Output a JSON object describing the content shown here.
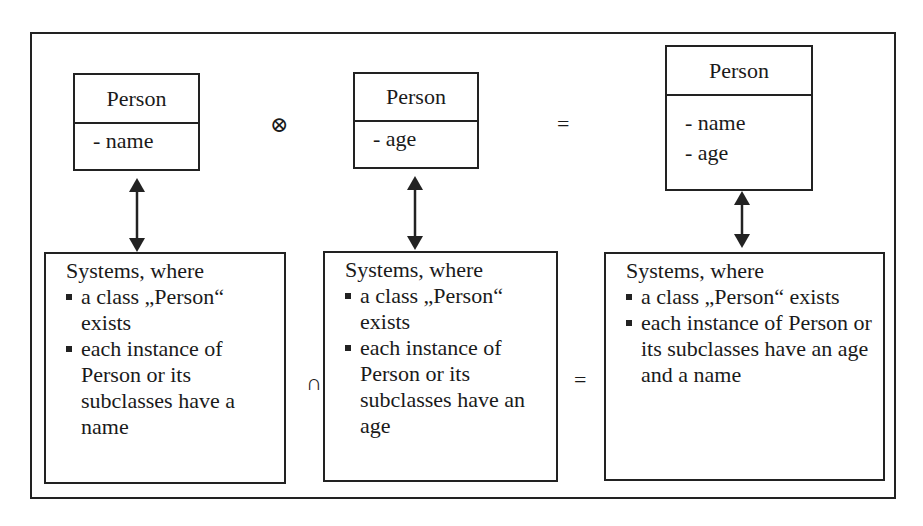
{
  "diagram": {
    "type": "set-semantics of UML class merge",
    "operators": {
      "model_merge": "⊗",
      "model_result": "=",
      "system_intersection": "∩",
      "system_result": "="
    },
    "class_boxes": [
      {
        "name": "Person",
        "attributes": [
          "- name"
        ]
      },
      {
        "name": "Person",
        "attributes": [
          "- age"
        ]
      },
      {
        "name": "Person",
        "attributes": [
          "- name",
          "- age"
        ]
      }
    ],
    "system_boxes": [
      {
        "title": "Systems, where",
        "items": [
          "a class „Person“ exists",
          "each instance of Person or its subclasses have a name"
        ]
      },
      {
        "title": "Systems, where",
        "items": [
          "a class „Person“ exists",
          "each instance of Person or its subclasses have an age"
        ]
      },
      {
        "title": "Systems, where",
        "items": [
          "a class „Person“ exists",
          "each instance of Person or its subclasses have an age and a name"
        ]
      }
    ],
    "connectors": [
      {
        "from": "class_boxes.0",
        "to": "system_boxes.0",
        "style": "double-headed arrow"
      },
      {
        "from": "class_boxes.1",
        "to": "system_boxes.1",
        "style": "double-headed arrow"
      },
      {
        "from": "class_boxes.2",
        "to": "system_boxes.2",
        "style": "double-headed arrow"
      }
    ],
    "colors": {
      "stroke": "#222222",
      "background": "#ffffff",
      "text": "#1a1a1a"
    }
  }
}
